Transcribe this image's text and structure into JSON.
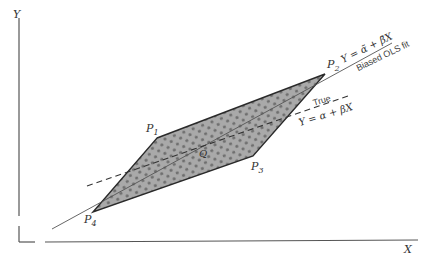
{
  "axes": {
    "y_label": "Y",
    "x_label": "X"
  },
  "points": {
    "p1": {
      "label": "P",
      "sub": "1"
    },
    "p2": {
      "label": "P",
      "sub": "2"
    },
    "p3": {
      "label": "P",
      "sub": "3"
    },
    "p4": {
      "label": "P",
      "sub": "4"
    },
    "q": {
      "label": "Q"
    }
  },
  "lines": {
    "biased": {
      "equation": "Y = α̃ + β̃X",
      "caption": "Biased OLS fit"
    },
    "true": {
      "caption": "True",
      "equation": "Y = α + βX"
    }
  },
  "colors": {
    "region_fill": "#a9a9a9",
    "dot": "#6e6e6e",
    "outline": "#2a2a2a",
    "line": "#555555"
  }
}
